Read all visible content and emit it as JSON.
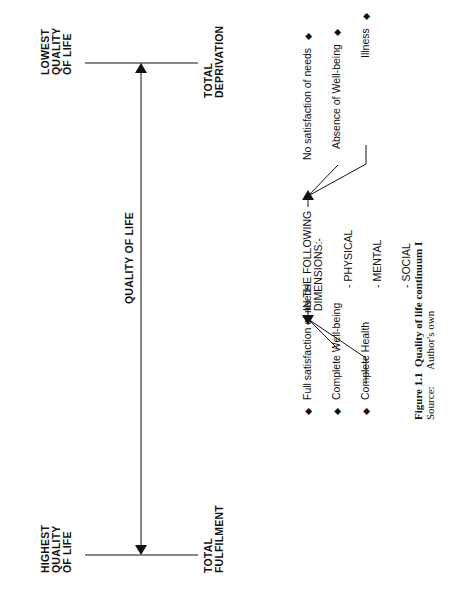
{
  "continuum": {
    "axis_label": "QUALITY OF LIFE",
    "high_end": {
      "label_lines": [
        "HIGHEST",
        "QUALITY",
        "OF LIFE"
      ],
      "state_lines": [
        "TOTAL",
        "FULFILMENT"
      ]
    },
    "low_end": {
      "label_lines": [
        "LOWEST",
        "QUALITY",
        "OF LIFE"
      ],
      "state_lines": [
        "TOTAL",
        "DEPRIVATION"
      ]
    }
  },
  "dimensions": {
    "heading_lines": [
      "IN THE FOLLOWING",
      "DIMENSIONS:-"
    ],
    "items": [
      "- PHYSICAL",
      "- MENTAL",
      "- SOCIAL"
    ]
  },
  "positive_factors": [
    "Full satisfaction of needs",
    "Complete Well-being",
    "Complete Health"
  ],
  "negative_factors": [
    "No satisfaction of needs",
    "Absence of Well-being",
    "Illness"
  ],
  "bullet_symbol": "◆",
  "caption": {
    "figure_label": "Figure 1.1",
    "figure_title": "Quality of life continuum I",
    "source_label": "Source:",
    "source_value": "Author's own"
  },
  "colors": {
    "ink": "#111111",
    "background": "#ffffff"
  }
}
